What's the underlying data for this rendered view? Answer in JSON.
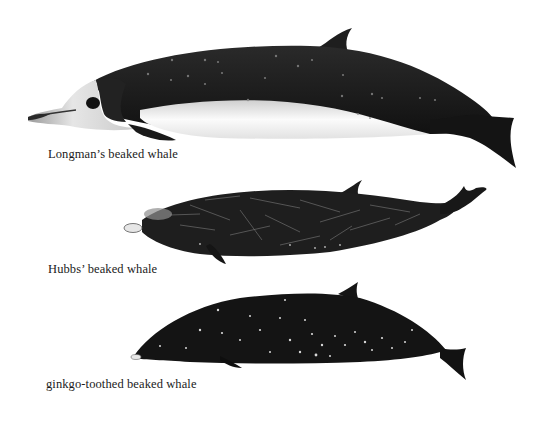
{
  "plate": {
    "background": "#ffffff",
    "species": [
      {
        "name": "Longman's beaked whale",
        "caption": "Longman’s beaked whale",
        "body_color": "#1c1c1c",
        "belly_color": "#f2f2f2"
      },
      {
        "name": "Hubbs' beaked whale",
        "caption": "Hubbs’ beaked whale",
        "body_color": "#1e1e1e",
        "scar_color": "#9a9a9a"
      },
      {
        "name": "ginkgo-toothed beaked whale",
        "caption": "ginkgo-toothed beaked whale",
        "body_color": "#141414",
        "spot_color": "#d8d8d8"
      }
    ]
  }
}
